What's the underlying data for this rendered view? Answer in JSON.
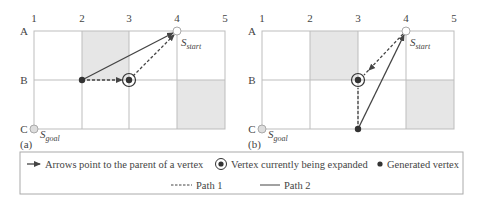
{
  "panels": [
    {
      "id": "a",
      "caption": "(a)",
      "columns": [
        "1",
        "2",
        "3",
        "4",
        "5"
      ],
      "rows": [
        "A",
        "B",
        "C"
      ],
      "start_label": "S",
      "start_sub": "start",
      "goal_label": "S",
      "goal_sub": "goal",
      "blocked_cells": [
        [
          "A",
          "2"
        ],
        [
          "B",
          "4"
        ]
      ]
    },
    {
      "id": "b",
      "caption": "(b)",
      "columns": [
        "1",
        "2",
        "3",
        "4",
        "5"
      ],
      "rows": [
        "A",
        "B",
        "C"
      ],
      "start_label": "S",
      "start_sub": "start",
      "goal_label": "S",
      "goal_sub": "goal",
      "blocked_cells": [
        [
          "A",
          "2"
        ],
        [
          "B",
          "4"
        ]
      ]
    }
  ],
  "legend": {
    "arrow_text": "Arrows point to the parent of a vertex",
    "expanded_text": "Vertex currently being expanded",
    "generated_text": "Generated vertex",
    "path1_text": "Path 1",
    "path2_text": "Path 2"
  },
  "colors": {
    "grid": "#bdbdbd",
    "blocked": "#e6e6e6",
    "line": "#444444",
    "vertex": "#333333"
  }
}
